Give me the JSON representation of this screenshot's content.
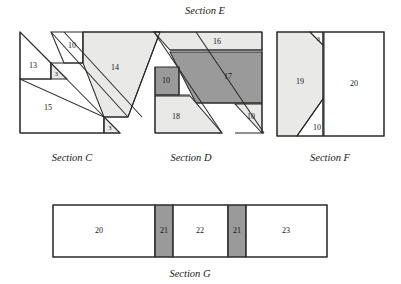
{
  "figure": {
    "type": "geometry-diagram",
    "palette": {
      "stroke": "#2b2b2b",
      "fill_white": "#ffffff",
      "fill_light": "#e9e9e7",
      "fill_dark": "#9a9a9a",
      "text": "#161616"
    }
  },
  "section_labels": [
    {
      "id": "section-e",
      "text": "Section E",
      "x": 205,
      "y": 14
    },
    {
      "id": "section-c",
      "text": "Section C",
      "x": 72,
      "y": 161
    },
    {
      "id": "section-d",
      "text": "Section D",
      "x": 191,
      "y": 161
    },
    {
      "id": "section-f",
      "text": "Section F",
      "x": 330,
      "y": 161
    },
    {
      "id": "section-g",
      "text": "Section G",
      "x": 190,
      "y": 277
    }
  ],
  "pieces": [
    {
      "id": "piece-13",
      "label": "13",
      "fill": "#ffffff",
      "points": "20,32 20,79 51,79 51,63",
      "label_x": 33,
      "label_y": 66
    },
    {
      "id": "piece-3-c-upper",
      "label": "3",
      "fill": "#e9e9e7",
      "points": "51,63 51,79 67,79",
      "label_x": 56.5,
      "label_y": 74.5,
      "small": true
    },
    {
      "id": "piece-15",
      "label": "15",
      "fill": "#ffffff",
      "points": "20,79 20,133 104,133 104,117",
      "label_x": 48,
      "label_y": 108
    },
    {
      "id": "piece-3-c-lower",
      "label": "3",
      "fill": "#e9e9e7",
      "points": "104,117 104,133 120,133",
      "label_x": 110,
      "label_y": 128.5,
      "small": true
    },
    {
      "id": "piece-10-e-left",
      "label": "10",
      "fill": "#ffffff",
      "points": "51,32 83,32 83,63 51,63 51,32",
      "points_clip": "51,32 83,32 83,63 64,63",
      "label_x": 72,
      "label_y": 46
    },
    {
      "id": "piece-14",
      "label": "14",
      "fill": "#e9e9e7",
      "points": "83,32 124,32 160,32 128,117 104,117 83,63",
      "label_x": 115,
      "label_y": 68
    },
    {
      "id": "piece-16",
      "label": "16",
      "fill": "#e9e9e7",
      "points": "170,50 262,50 262,32 154,32",
      "label_x": 217,
      "label_y": 42
    },
    {
      "id": "piece-17",
      "label": "17",
      "fill": "#9a9a9a",
      "points": "170,52 262,52 262,103 196,103",
      "label_x": 228,
      "label_y": 77
    },
    {
      "id": "piece-10-d-mid",
      "label": "10",
      "fill": "#9a9a9a",
      "points": "155,67 179,67 179,95 155,95",
      "label_x": 166,
      "label_y": 81
    },
    {
      "id": "piece-18",
      "label": "18",
      "fill": "#e9e9e7",
      "points": "155,96 190,96 222,133 155,133",
      "label_x": 176,
      "label_y": 117
    },
    {
      "id": "piece-10-d-right",
      "label": "10",
      "fill": "#e9e9e7",
      "points": "235,104 262,104 262,133",
      "label_x": 251,
      "label_y": 117
    },
    {
      "id": "piece-19",
      "label": "19",
      "fill": "#e9e9e7",
      "points": "277,32 310,32 323,45 323,99 297,136 277,136",
      "label_x": 300,
      "label_y": 82
    },
    {
      "id": "piece-3-f",
      "label": "3",
      "fill": "#ffffff",
      "points": "310,32 323,32 323,45",
      "label_x": 318.5,
      "label_y": 39,
      "small": true
    },
    {
      "id": "piece-10-f",
      "label": "10",
      "fill": "#ffffff",
      "points": "323,99 323,136 297,136",
      "label_x": 317,
      "label_y": 128
    },
    {
      "id": "piece-20-f",
      "label": "20",
      "fill": "#ffffff",
      "points": "324,32 384,32 384,136 324,136",
      "label_x": 354,
      "label_y": 84
    },
    {
      "id": "piece-20-g",
      "label": "20",
      "fill": "#ffffff",
      "points": "53,205 155,205 155,257 53,257",
      "label_x": 99,
      "label_y": 231
    },
    {
      "id": "piece-21-g-left",
      "label": "21",
      "fill": "#9a9a9a",
      "points": "155,205 173,205 173,257 155,257",
      "label_x": 164,
      "label_y": 231
    },
    {
      "id": "piece-22-g",
      "label": "22",
      "fill": "#ffffff",
      "points": "173,205 228,205 228,257 173,257",
      "label_x": 200,
      "label_y": 231
    },
    {
      "id": "piece-21-g-right",
      "label": "21",
      "fill": "#9a9a9a",
      "points": "228,205 246,205 246,257 228,257",
      "label_x": 237,
      "label_y": 231
    },
    {
      "id": "piece-23-g",
      "label": "23",
      "fill": "#ffffff",
      "points": "246,205 327,205 327,257 246,257",
      "label_x": 286,
      "label_y": 231
    }
  ],
  "edges": [
    {
      "id": "edge-c-hyp",
      "d": "M20,32 L120,133"
    },
    {
      "id": "edge-c-band-upper",
      "d": "M51,32 L128,117"
    },
    {
      "id": "edge-c-band-lower",
      "d": "M64,32 L142,117"
    },
    {
      "id": "edge-c-inner-13",
      "d": "M20,79 L51,79"
    },
    {
      "id": "edge-c-vert-13",
      "d": "M51,63 L51,79"
    },
    {
      "id": "edge-10e-bottom",
      "d": "M51,63 L83,63"
    },
    {
      "id": "edge-10e-right",
      "d": "M83,32 L83,63"
    },
    {
      "id": "edge-c-base",
      "d": "M20,133 L120,133"
    },
    {
      "id": "edge-c-left",
      "d": "M20,32 L20,133"
    },
    {
      "id": "edge-14-top",
      "d": "M83,32 L160,32"
    },
    {
      "id": "edge-14-diag",
      "d": "M160,32 L128,117"
    },
    {
      "id": "edge-14-bottom",
      "d": "M104,117 L128,117"
    },
    {
      "id": "edge-15-step",
      "d": "M104,117 L104,133"
    },
    {
      "id": "edge-d-top",
      "d": "M154,32 L262,32"
    },
    {
      "id": "edge-d-hyp1",
      "d": "M154,32 L222,133"
    },
    {
      "id": "edge-d-hyp2",
      "d": "M196,32 L264,133"
    },
    {
      "id": "edge-16-bottom",
      "d": "M170,50 L262,50"
    },
    {
      "id": "edge-17-bottom",
      "d": "M196,103 L262,103"
    },
    {
      "id": "edge-d-right",
      "d": "M262,32 L262,133"
    },
    {
      "id": "edge-d-left",
      "d": "M155,67 L155,133"
    },
    {
      "id": "edge-10d-bottom",
      "d": "M155,95 L190,95"
    },
    {
      "id": "edge-10d-right",
      "d": "M179,67 L179,95"
    },
    {
      "id": "edge-d-base",
      "d": "M155,133 L222,133"
    },
    {
      "id": "edge-d-base2",
      "d": "M235,133 L264,133"
    },
    {
      "id": "edge-f-outer",
      "d": "M277,32 L384,32 L384,136 L277,136 Z"
    },
    {
      "id": "edge-f-split",
      "d": "M323,32 L323,136"
    },
    {
      "id": "edge-f-corner3",
      "d": "M310,32 L323,45"
    },
    {
      "id": "edge-f-corner10",
      "d": "M323,99 L297,136"
    },
    {
      "id": "edge-g-outer",
      "d": "M53,205 L327,205 L327,257 L53,257 Z"
    },
    {
      "id": "edge-g-div1",
      "d": "M155,205 L155,257"
    },
    {
      "id": "edge-g-div2",
      "d": "M173,205 L173,257"
    },
    {
      "id": "edge-g-div3",
      "d": "M228,205 L228,257"
    },
    {
      "id": "edge-g-div4",
      "d": "M246,205 L246,257"
    }
  ]
}
